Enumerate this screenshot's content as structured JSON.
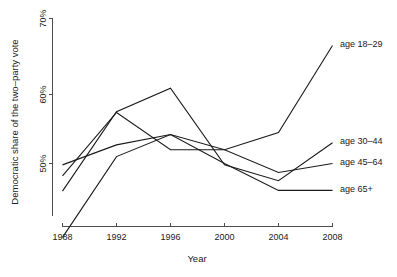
{
  "chart_data": {
    "type": "line",
    "title": "",
    "xlabel": "Year",
    "ylabel": "Democratic share of the two–party vote",
    "x": [
      1988,
      1992,
      1996,
      2000,
      2004,
      2008
    ],
    "xtick_labels": [
      "1988",
      "1992",
      "1996",
      "2000",
      "2004",
      "2008"
    ],
    "ytick_labels": [
      "50%",
      "60%",
      "70%"
    ],
    "ytick_values": [
      50,
      60,
      70
    ],
    "xlim": [
      1988,
      2008
    ],
    "ylim": [
      39,
      70
    ],
    "grid": false,
    "legend": "inline-right-labels",
    "series": [
      {
        "name": "age 18–29",
        "label": "age 18–29",
        "values": [
          39.3,
          51.0,
          54.2,
          52.0,
          54.5,
          67.1
        ]
      },
      {
        "name": "age 30–44",
        "label": "age 30–44",
        "values": [
          46.0,
          57.5,
          60.9,
          49.8,
          47.5,
          53.0
        ]
      },
      {
        "name": "age 45–64",
        "label": "age 45–64",
        "values": [
          48.2,
          57.4,
          52.0,
          52.0,
          48.7,
          50.0
        ]
      },
      {
        "name": "age 65+",
        "label": "age 65+",
        "values": [
          49.8,
          52.7,
          54.2,
          50.0,
          46.1,
          46.1
        ]
      }
    ]
  },
  "labels": {
    "y_axis_title": "Democratic share of the two–party vote",
    "x_axis_title": "Year",
    "ytick_0": "50%",
    "ytick_1": "60%",
    "ytick_2": "70%",
    "xtick_0": "1988",
    "xtick_1": "1992",
    "xtick_2": "1996",
    "xtick_3": "2000",
    "xtick_4": "2004",
    "xtick_5": "2008",
    "series_0": "age 18–29",
    "series_1": "age 30–44",
    "series_2": "age 45–64",
    "series_3": "age 65+"
  },
  "colors": {
    "line": "#1a1a1a",
    "axis": "#4d4d4d",
    "background": "#ffffff"
  }
}
